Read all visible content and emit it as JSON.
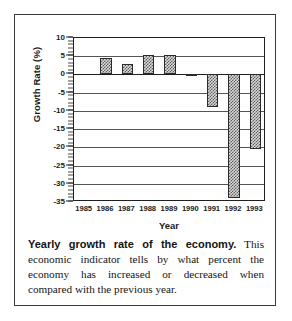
{
  "figure": {
    "caption_title": "Yearly growth rate of the economy.",
    "caption_body": " This economic indicator tells by what percent the economy has increased or decreased when compared with the previous year."
  },
  "chart_data": {
    "type": "bar",
    "title": "",
    "xlabel": "Year",
    "ylabel": "Growth Rate (%)",
    "categories": [
      "1985",
      "1986",
      "1987",
      "1988",
      "1989",
      "1990",
      "1991",
      "1992",
      "1993"
    ],
    "values": [
      0,
      4.5,
      2.8,
      5.2,
      5.4,
      -0.3,
      -9.0,
      -34.0,
      -20.5
    ],
    "ylim": [
      -35,
      10
    ],
    "ytick_labels": [
      "10",
      "5",
      "0",
      "-5",
      "-10",
      "-15",
      "-20",
      "-25",
      "-30",
      "-35"
    ],
    "ytick_values": [
      10,
      5,
      0,
      -5,
      -10,
      -15,
      -20,
      -25,
      -30,
      -35
    ],
    "ytick_step": 5,
    "yminor_step": 1,
    "grid": true,
    "legend": "none",
    "bar_fill": "#d8d8d8",
    "bar_edge": "#2b2b2b",
    "axis_color": "#1f1f1f"
  }
}
